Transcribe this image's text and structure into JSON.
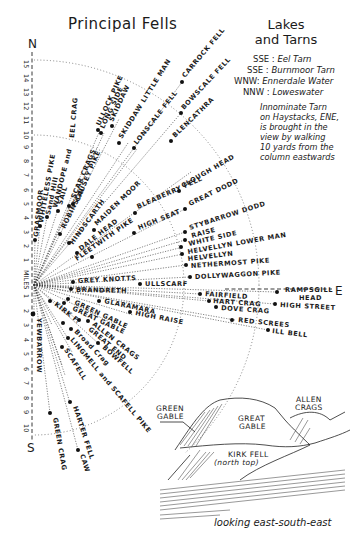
{
  "title": "Principal Fells",
  "compass": {
    "north": "N",
    "south": "S",
    "east": "E"
  },
  "scale": {
    "unit_label": "MILES",
    "north_ticks": [
      "15",
      "14",
      "13",
      "12",
      "11",
      "10",
      "9",
      "8",
      "7",
      "6",
      "5",
      "4",
      "3",
      "2",
      "1"
    ],
    "south_ticks": [
      "1",
      "2",
      "3",
      "4",
      "5",
      "6",
      "7",
      "8",
      "9",
      "10"
    ]
  },
  "lakes_and_tarns": {
    "title_line1": "Lakes",
    "title_line2": "and Tarns",
    "entries": [
      {
        "bearing": "SSE",
        "name": "Eel Tarn"
      },
      {
        "bearing": "SSE",
        "name": "Burnmoor Tarn"
      },
      {
        "bearing": "WNW",
        "name": "Ennerdale Water"
      },
      {
        "bearing": "NNW",
        "name": "Loweswater"
      }
    ],
    "note_lines": [
      "Innominate Tarn",
      "on Haystacks, ENE,",
      "is brought in the",
      "view by walking",
      "10 yards from the",
      "column eastwards"
    ]
  },
  "fells": {
    "grasmoor": "GRASMOOR",
    "whiteless_pike": "WHITELESS PIKE",
    "sand_hill": "Sand Hill",
    "hopegill": "HOPEGILL HEAD",
    "wandope": "WANDOPE and",
    "eel_crag": "EEL CRAG",
    "sail": "SAIL",
    "scar_crags": "SCAR CRAGS",
    "causey_pike": "CAUSEY PIKE",
    "robinson": "ROBINSON",
    "hindscarth": "HINDSCARTH",
    "maiden_moor": "MAIDEN MOOR",
    "dale_head": "DALE HEAD",
    "fleetwith": "FLEETWITH PIKE",
    "ullock_pike": "ULLOCK PIKE",
    "long_side": "LONG SIDE",
    "skiddaw": "SKIDDAW",
    "skiddaw_little_man": "SKIDDAW LITTLE MAN",
    "lonscale_fell": "LONSCALE FELL",
    "carrock_fell": "CARROCK FELL",
    "bowscale_fell": "BOWSCALE FELL",
    "blencathra": "BLENCATHRA",
    "bleaberry_fell": "BLEABERRY FELL",
    "clough_head": "CLOUGH HEAD",
    "high_seat": "HIGH SEAT",
    "great_dodd": "GREAT DODD",
    "stybarrow_dodd": "STYBARROW DODD",
    "raise": "RAISE",
    "white_side": "WHITE SIDE",
    "helvellyn_lower_man": "HELVELLYN LOWER MAN",
    "helvellyn": "HELVELLYN",
    "nethermost_pike": "NETHERMOST PIKE",
    "dollywaggon_pike": "DOLLYWAGGON PIKE",
    "grey_knotts": "GREY KNOTTS",
    "brandreth": "BRANDRETH",
    "ullscarf": "ULLSCARF",
    "rampsgill_head_1": "RAMPSGILL",
    "rampsgill_head_2": "HEAD",
    "fairfield": "FAIRFIELD",
    "hart_crag": "HART CRAG",
    "dove_crag": "DOVE CRAG",
    "high_street": "HIGH STREET",
    "red_screes": "RED SCREES",
    "ill_bell": "ILL BELL",
    "glaramara": "GLARAMARA",
    "high_raise": "HIGH RAISE",
    "green_gable": "GREEN GABLE",
    "great_gable": "GREAT GABLE",
    "kirk_fell": "KIRK F.",
    "allen_crags": "ALLEN CRAGS",
    "great_end": "GREAT END",
    "bowfell": "BOWFELL",
    "broad_crag": "Broad Crag",
    "lingmell": "LINGMELL and SCAFELL PIKE",
    "scafell": "SCAFELL",
    "yewbarrow": "YEWBARROW",
    "green_crag": "GREEN CRAG",
    "harter_fell": "HARTER FELL",
    "caw": "CAW"
  },
  "sketch": {
    "green_gable_1": "GREEN",
    "green_gable_2": "GABLE",
    "great_gable_1": "GREAT",
    "great_gable_2": "GABLE",
    "allen_crags_1": "ALLEN",
    "allen_crags_2": "CRAGS",
    "kirk_fell_1": "KIRK FELL",
    "kirk_fell_2": "(north top)",
    "caption": "looking east-south-east"
  }
}
